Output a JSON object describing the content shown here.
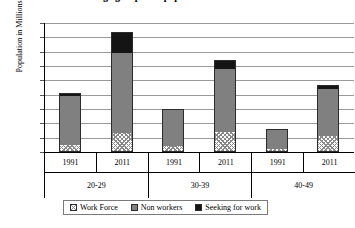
{
  "chart_data": {
    "type": "bar",
    "subtype": "stacked-column",
    "title": "Age group wise population of workers",
    "xlabel": "",
    "ylabel": "Population in Millions",
    "ylim": [
      0,
      45
    ],
    "ytick_step": 5,
    "yticks": [
      "45",
      "40",
      "35",
      "30",
      "25",
      "20",
      "15",
      "10",
      "5",
      "0"
    ],
    "grid": true,
    "legend_position": "bottom",
    "categories": [
      "1991",
      "2011",
      "1991",
      "2011",
      "1991",
      "2011"
    ],
    "groups": [
      {
        "label": "20-29",
        "years": [
          "1991",
          "2011"
        ]
      },
      {
        "label": "30-39",
        "years": [
          "1991",
          "2011"
        ]
      },
      {
        "label": "40-49",
        "years": [
          "1991",
          "2011"
        ]
      }
    ],
    "series": [
      {
        "name": "Work Force",
        "color": "#ffffff",
        "pattern": "crosshatch",
        "values": [
          2.0,
          6.3,
          1.8,
          6.8,
          0.9,
          5.5
        ]
      },
      {
        "name": "Non workers",
        "color": "#808080",
        "pattern": "solid",
        "values": [
          17.7,
          28.5,
          13.1,
          22.5,
          7.0,
          16.8
        ]
      },
      {
        "name": "Seeking for work",
        "color": "#141414",
        "pattern": "solid",
        "values": [
          0.9,
          7.0,
          0.1,
          2.7,
          0.1,
          1.1
        ]
      }
    ],
    "totals": [
      20.6,
      41.8,
      15.0,
      32.0,
      8.0,
      23.4
    ]
  }
}
